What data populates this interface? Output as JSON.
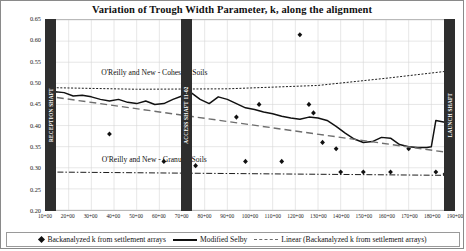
{
  "chart_data": {
    "type": "line",
    "title": "Variation of Trough Width Parameter, k, along the alignment",
    "xlabel": "",
    "ylabel": "",
    "ylim": [
      0.2,
      0.65
    ],
    "yticks": [
      "0.20",
      "0.25",
      "0.30",
      "0.35",
      "0.40",
      "0.45",
      "0.50",
      "0.55",
      "0.60",
      "0.65"
    ],
    "xlim": [
      1000,
      1900
    ],
    "xticks": [
      "10+00",
      "20+00",
      "30+00",
      "40+00",
      "50+00",
      "60+00",
      "70+00",
      "80+00",
      "90+00",
      "100+00",
      "110+00",
      "120+00",
      "130+00",
      "140+00",
      "150+00",
      "160+00",
      "170+00",
      "180+00",
      "190+00"
    ],
    "grid": true,
    "legend_position": "bottom",
    "series": [
      {
        "name": "Backanalyzed k from settlement arrays",
        "style": "scatter",
        "points": [
          [
            1140,
            0.38
          ],
          [
            1260,
            0.315
          ],
          [
            1330,
            0.305
          ],
          [
            1420,
            0.42
          ],
          [
            1440,
            0.315
          ],
          [
            1470,
            0.45
          ],
          [
            1520,
            0.315
          ],
          [
            1560,
            0.615
          ],
          [
            1580,
            0.45
          ],
          [
            1590,
            0.43
          ],
          [
            1610,
            0.36
          ],
          [
            1640,
            0.345
          ],
          [
            1650,
            0.29
          ],
          [
            1700,
            0.29
          ],
          [
            1760,
            0.29
          ],
          [
            1800,
            0.345
          ],
          [
            1860,
            0.29
          ],
          [
            1880,
            0.285
          ]
        ]
      },
      {
        "name": "Modified Selby",
        "style": "solid-line",
        "points": [
          [
            1000,
            0.47
          ],
          [
            1020,
            0.48
          ],
          [
            1040,
            0.478
          ],
          [
            1060,
            0.47
          ],
          [
            1080,
            0.472
          ],
          [
            1100,
            0.468
          ],
          [
            1120,
            0.462
          ],
          [
            1140,
            0.458
          ],
          [
            1160,
            0.462
          ],
          [
            1180,
            0.455
          ],
          [
            1200,
            0.452
          ],
          [
            1220,
            0.458
          ],
          [
            1240,
            0.45
          ],
          [
            1260,
            0.452
          ],
          [
            1280,
            0.462
          ],
          [
            1300,
            0.47
          ],
          [
            1320,
            0.478
          ],
          [
            1340,
            0.462
          ],
          [
            1360,
            0.452
          ],
          [
            1380,
            0.468
          ],
          [
            1400,
            0.462
          ],
          [
            1420,
            0.452
          ],
          [
            1440,
            0.442
          ],
          [
            1460,
            0.438
          ],
          [
            1480,
            0.432
          ],
          [
            1500,
            0.428
          ],
          [
            1520,
            0.422
          ],
          [
            1540,
            0.418
          ],
          [
            1560,
            0.415
          ],
          [
            1580,
            0.42
          ],
          [
            1600,
            0.418
          ],
          [
            1620,
            0.412
          ],
          [
            1640,
            0.398
          ],
          [
            1660,
            0.382
          ],
          [
            1680,
            0.368
          ],
          [
            1700,
            0.36
          ],
          [
            1720,
            0.362
          ],
          [
            1740,
            0.372
          ],
          [
            1760,
            0.37
          ],
          [
            1780,
            0.355
          ],
          [
            1800,
            0.35
          ],
          [
            1820,
            0.348
          ],
          [
            1840,
            0.348
          ],
          [
            1850,
            0.35
          ],
          [
            1860,
            0.412
          ],
          [
            1880,
            0.408
          ],
          [
            1895,
            0.405
          ]
        ]
      },
      {
        "name": "Linear (Backanalyzed k from settlement arrays)",
        "style": "dashed-line",
        "points": [
          [
            1000,
            0.47
          ],
          [
            1895,
            0.335
          ]
        ]
      },
      {
        "name": "O'Reilly and New - Cohesive Soils",
        "style": "dotted-line",
        "points": [
          [
            1000,
            0.49
          ],
          [
            1200,
            0.486
          ],
          [
            1400,
            0.487
          ],
          [
            1600,
            0.495
          ],
          [
            1750,
            0.512
          ],
          [
            1895,
            0.53
          ]
        ]
      },
      {
        "name": "O'Reilly and New - Granular Soils",
        "style": "dashdot-line",
        "points": [
          [
            1000,
            0.29
          ],
          [
            1895,
            0.282
          ]
        ]
      }
    ],
    "annotations": [
      {
        "text": "O'Reilly and New - Cohesive Soils",
        "x": 1240,
        "y": 0.515
      },
      {
        "text": "O'Reilly and New - Granular Soils",
        "x": 1240,
        "y": 0.31
      }
    ],
    "shafts": [
      {
        "label": "RECEPTION SHAFT",
        "x": 1010
      },
      {
        "label": "ACCESS SHAFT 11-02",
        "x": 1310
      },
      {
        "label": "LAUNCH SHAFT",
        "x": 1900
      }
    ]
  },
  "legend": {
    "items": [
      {
        "label": "Backanalyzed k from settlement arrays",
        "marker": "diamond-marker"
      },
      {
        "label": "Modified Selby",
        "marker": "solid-line-marker"
      },
      {
        "label": "Linear (Backanalyzed k from settlement arrays)",
        "marker": "dashed-line-marker"
      }
    ]
  }
}
